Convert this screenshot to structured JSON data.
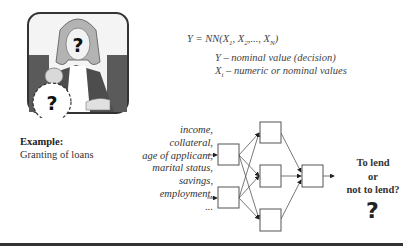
{
  "illustration": {
    "description": "woman-with-question-face-and-money-bag",
    "face_mark": "?",
    "bag_mark": "?",
    "colors": {
      "frame": "#444444",
      "hair": "#b0b0b0",
      "jacket": "#555555",
      "background_panel": "#666666"
    }
  },
  "example": {
    "label": "Example:",
    "text": "Granting of loans"
  },
  "formula": {
    "lhs": "Y",
    "eq": " = NN(",
    "x1": "X",
    "x1_sub": "1",
    "sep1": ", ",
    "x2": "X",
    "x2_sub": "2",
    "sep2": ",..., ",
    "xn": "X",
    "xn_sub": "N",
    "close": ")"
  },
  "definitions": {
    "y_def": "Y – nominal value (decision)",
    "x_var": "X",
    "x_sub": "i",
    "x_def": " – numeric or nominal values"
  },
  "inputs": {
    "items": [
      "income,",
      "collateral,",
      "age of applicant,",
      "marital status,",
      "savings,",
      "employment,",
      "..."
    ]
  },
  "network": {
    "layers": [
      2,
      3,
      1
    ],
    "input_nodes": 2,
    "hidden_nodes": 3,
    "output_nodes": 1
  },
  "decision": {
    "line1": "To lend",
    "line2": "or",
    "line3": "not to lend?",
    "mark": "?"
  }
}
